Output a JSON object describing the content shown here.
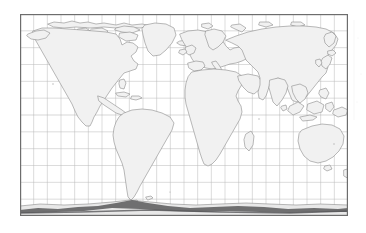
{
  "document": {
    "type": "map",
    "title": "World Map",
    "description": "Scanned outline world map with latitude/longitude graticule",
    "page_background": "#ffffff"
  },
  "map": {
    "name": "world-outline-map",
    "projection": "equirectangular",
    "frame": {
      "x": 20,
      "y": 14,
      "width": 328,
      "height": 202,
      "border_color": "#6d6d6d",
      "border_width_px": 1.2
    },
    "ocean_fill": "#ffffff",
    "land_fill": "#f1f1f1",
    "coastline_color": "#8c8c8c",
    "coastline_width_px": 0.6,
    "graticule": {
      "visible": true,
      "color": "#b9b9b9",
      "width_px": 0.5,
      "meridian_spacing_degrees": 15,
      "parallel_spacing_degrees": 15,
      "meridian_count": 23,
      "parallel_count": 11,
      "lon_min": -180,
      "lon_max": 180,
      "lat_min": -90,
      "lat_max": 90
    },
    "antarctic_band": {
      "visible": true,
      "color": "#59595b",
      "label": "antarctica-coastline"
    },
    "features": [
      {
        "name": "north-america",
        "label": "North America"
      },
      {
        "name": "south-america",
        "label": "South America"
      },
      {
        "name": "greenland",
        "label": "Greenland"
      },
      {
        "name": "europe",
        "label": "Europe"
      },
      {
        "name": "africa",
        "label": "Africa"
      },
      {
        "name": "asia",
        "label": "Asia"
      },
      {
        "name": "australia",
        "label": "Australia"
      },
      {
        "name": "new-zealand",
        "label": "New Zealand"
      },
      {
        "name": "madagascar",
        "label": "Madagascar"
      },
      {
        "name": "japan",
        "label": "Japan"
      },
      {
        "name": "indonesia",
        "label": "Indonesia"
      },
      {
        "name": "british-isles",
        "label": "British Isles"
      },
      {
        "name": "arctic-islands",
        "label": "Arctic Islands"
      },
      {
        "name": "antarctica",
        "label": "Antarctica"
      }
    ],
    "labels": []
  }
}
